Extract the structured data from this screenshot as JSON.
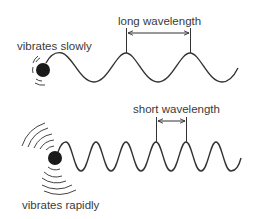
{
  "top": {
    "label_left": "vibrates slowly",
    "label_wave": "long wavelength",
    "description": "slow vibration produces long wavelength"
  },
  "bottom": {
    "label_left": "vibrates rapidly",
    "label_wave": "short wavelength",
    "description": "rapid vibration produces short wavelength"
  },
  "colors": {
    "line": "#333333",
    "ball": "#1a1a1a",
    "text": "#3a3a3a",
    "background": "#ffffff"
  }
}
